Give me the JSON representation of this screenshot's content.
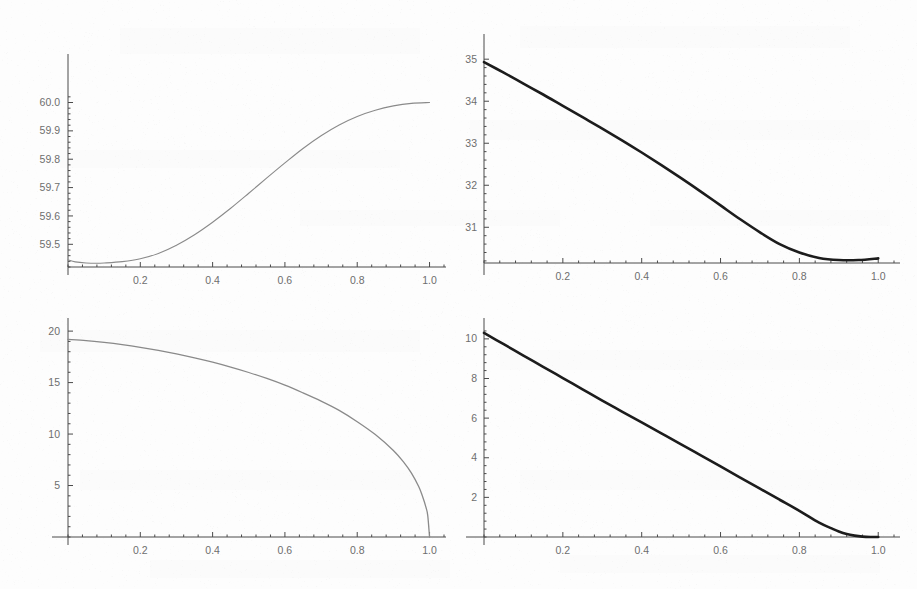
{
  "figure": {
    "title": "",
    "background_color": "#fdfdfd",
    "panel_count": 4,
    "layout": "2x2 grid of line plots (scanned page)"
  },
  "chart_data": [
    {
      "id": "top-left",
      "type": "line",
      "title": "",
      "xlabel": "",
      "ylabel": "",
      "xlim": [
        0,
        1.04
      ],
      "ylim": [
        59.42,
        60.03
      ],
      "grid": false,
      "legend": null,
      "line_color": "#8a8a8a",
      "line_width": 1.1,
      "xticks": [
        0.2,
        0.4,
        0.6,
        0.8,
        1.0
      ],
      "xticklabels": [
        "0.2",
        "0.4",
        "0.6",
        "0.8",
        "1.0"
      ],
      "yticks": [
        59.5,
        59.6,
        59.7,
        59.8,
        59.9,
        60.0
      ],
      "yticklabels": [
        "59.5",
        "59.6",
        "59.7",
        "59.8",
        "59.9",
        "60.0"
      ],
      "x": [
        0.0,
        0.02,
        0.05,
        0.08,
        0.1,
        0.15,
        0.2,
        0.25,
        0.3,
        0.35,
        0.4,
        0.45,
        0.5,
        0.55,
        0.6,
        0.65,
        0.7,
        0.75,
        0.8,
        0.85,
        0.9,
        0.95,
        1.0
      ],
      "y": [
        59.445,
        59.438,
        59.434,
        59.433,
        59.434,
        59.439,
        59.449,
        59.468,
        59.497,
        59.534,
        59.578,
        59.627,
        59.68,
        59.734,
        59.787,
        59.838,
        59.883,
        59.921,
        59.951,
        59.973,
        59.988,
        59.997,
        60.0
      ]
    },
    {
      "id": "top-right",
      "type": "line",
      "title": "",
      "xlabel": "",
      "ylabel": "",
      "xlim": [
        0,
        1.04
      ],
      "ylim": [
        30.15,
        35.1
      ],
      "grid": false,
      "legend": null,
      "line_color": "#1c1c1c",
      "line_width": 2.6,
      "xticks": [
        0.2,
        0.4,
        0.6,
        0.8,
        1.0
      ],
      "xticklabels": [
        "0.2",
        "0.4",
        "0.6",
        "0.8",
        "1.0"
      ],
      "yticks": [
        31,
        32,
        33,
        34,
        35
      ],
      "yticklabels": [
        "31",
        "32",
        "33",
        "34",
        "35"
      ],
      "x": [
        0.0,
        0.05,
        0.1,
        0.15,
        0.2,
        0.25,
        0.3,
        0.35,
        0.4,
        0.45,
        0.5,
        0.55,
        0.6,
        0.65,
        0.7,
        0.75,
        0.8,
        0.85,
        0.9,
        0.95,
        1.0
      ],
      "y": [
        34.93,
        34.68,
        34.42,
        34.16,
        33.89,
        33.62,
        33.35,
        33.07,
        32.78,
        32.48,
        32.17,
        31.85,
        31.52,
        31.19,
        30.88,
        30.6,
        30.4,
        30.27,
        30.22,
        30.22,
        30.26
      ]
    },
    {
      "id": "bottom-left",
      "type": "line",
      "title": "",
      "xlabel": "",
      "ylabel": "",
      "xlim": [
        0,
        1.04
      ],
      "ylim": [
        0,
        20.4
      ],
      "grid": false,
      "legend": null,
      "line_color": "#8a8a8a",
      "line_width": 1.3,
      "xticks": [
        0.2,
        0.4,
        0.6,
        0.8,
        1.0
      ],
      "xticklabels": [
        "0.2",
        "0.4",
        "0.6",
        "0.8",
        "1.0"
      ],
      "yticks": [
        5,
        10,
        15,
        20
      ],
      "yticklabels": [
        "5",
        "10",
        "15",
        "20"
      ],
      "x": [
        0.0,
        0.05,
        0.1,
        0.15,
        0.2,
        0.25,
        0.3,
        0.35,
        0.4,
        0.45,
        0.5,
        0.55,
        0.6,
        0.65,
        0.7,
        0.75,
        0.8,
        0.85,
        0.9,
        0.93,
        0.95,
        0.97,
        0.98,
        0.99,
        0.995,
        1.0
      ],
      "y": [
        19.2,
        19.08,
        18.9,
        18.68,
        18.42,
        18.12,
        17.78,
        17.4,
        16.98,
        16.5,
        15.98,
        15.4,
        14.75,
        14.0,
        13.2,
        12.3,
        11.2,
        9.95,
        8.4,
        7.2,
        6.2,
        4.9,
        4.0,
        2.9,
        2.1,
        0.0
      ]
    },
    {
      "id": "bottom-right",
      "type": "line",
      "title": "",
      "xlabel": "",
      "ylabel": "",
      "xlim": [
        0,
        1.04
      ],
      "ylim": [
        0,
        10.7
      ],
      "grid": false,
      "legend": null,
      "line_color": "#1c1c1c",
      "line_width": 2.6,
      "xticks": [
        0.2,
        0.4,
        0.6,
        0.8,
        1.0
      ],
      "xticklabels": [
        "0.2",
        "0.4",
        "0.6",
        "0.8",
        "1.0"
      ],
      "yticks": [
        2,
        4,
        6,
        8,
        10
      ],
      "yticklabels": [
        "2",
        "4",
        "6",
        "8",
        "10"
      ],
      "x": [
        0.0,
        0.05,
        0.1,
        0.15,
        0.2,
        0.25,
        0.3,
        0.35,
        0.4,
        0.45,
        0.5,
        0.55,
        0.6,
        0.65,
        0.7,
        0.75,
        0.8,
        0.85,
        0.88,
        0.9,
        0.92,
        0.94,
        0.96,
        0.98,
        1.0
      ],
      "y": [
        10.3,
        9.73,
        9.16,
        8.59,
        8.02,
        7.45,
        6.88,
        6.33,
        5.78,
        5.23,
        4.68,
        4.12,
        3.56,
        3.0,
        2.44,
        1.88,
        1.32,
        0.72,
        0.45,
        0.28,
        0.15,
        0.07,
        0.02,
        0.0,
        0.0
      ]
    }
  ]
}
